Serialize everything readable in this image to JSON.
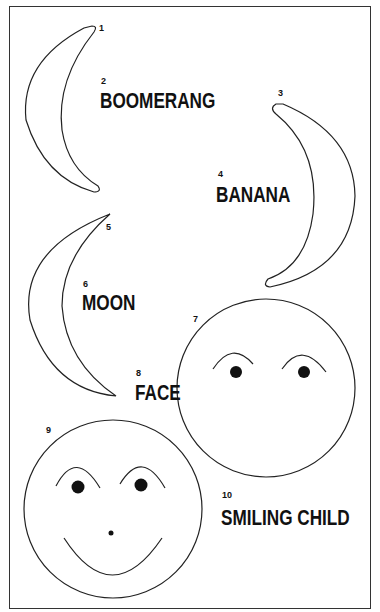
{
  "figure": {
    "items": [
      {
        "number": "1",
        "kind": "shape",
        "shape": "boomerang-crescent"
      },
      {
        "number": "2",
        "kind": "label",
        "label": "BOOMERANG"
      },
      {
        "number": "3",
        "kind": "shape",
        "shape": "banana-crescent"
      },
      {
        "number": "4",
        "kind": "label",
        "label": "BANANA"
      },
      {
        "number": "5",
        "kind": "shape",
        "shape": "moon-crescent"
      },
      {
        "number": "6",
        "kind": "label",
        "label": "MOON"
      },
      {
        "number": "7",
        "kind": "shape",
        "shape": "face-circle-with-brows-and-eyes"
      },
      {
        "number": "8",
        "kind": "label",
        "label": "FACE"
      },
      {
        "number": "9",
        "kind": "shape",
        "shape": "face-circle-with-brows-eyes-nose-smile"
      },
      {
        "number": "10",
        "kind": "label",
        "label": "SMILING CHILD"
      }
    ]
  },
  "nums": {
    "n1": "1",
    "n2": "2",
    "n3": "3",
    "n4": "4",
    "n5": "5",
    "n6": "6",
    "n7": "7",
    "n8": "8",
    "n9": "9",
    "n10": "10"
  },
  "labels": {
    "boomerang": "BOOMERANG",
    "banana": "BANANA",
    "moon": "MOON",
    "face": "FACE",
    "smiling_child": "SMILING CHILD"
  },
  "colors": {
    "ink": "#111111",
    "paper": "#ffffff"
  }
}
